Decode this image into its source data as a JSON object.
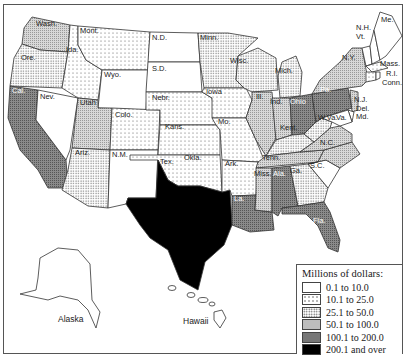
{
  "map": {
    "title": "Millions of dollars by state",
    "legend": {
      "title": "Millions of dollars:",
      "items": [
        {
          "label": "0.1 to 10.0",
          "class": "c1",
          "pattern": "white"
        },
        {
          "label": "10.1 to 25.0",
          "class": "c2",
          "pattern": "sparse-dots"
        },
        {
          "label": "25.1 to 50.0",
          "class": "c3",
          "pattern": "dense-dots"
        },
        {
          "label": "50.1 to 100.0",
          "class": "c4",
          "pattern": "light-gray-hatch"
        },
        {
          "label": "100.1 to 200.0",
          "class": "c5",
          "pattern": "dark-gray-hatch"
        },
        {
          "label": "200.1 and over",
          "class": "c6",
          "pattern": "black"
        }
      ]
    },
    "states": [
      {
        "abbr": "Wash.",
        "class": "c4"
      },
      {
        "abbr": "Ore.",
        "class": "c3"
      },
      {
        "abbr": "Cal.",
        "class": "c5"
      },
      {
        "abbr": "Ida.",
        "class": "c2"
      },
      {
        "abbr": "Nev.",
        "class": "c1"
      },
      {
        "abbr": "Mont.",
        "class": "c2"
      },
      {
        "abbr": "Wyo.",
        "class": "c1"
      },
      {
        "abbr": "Utah",
        "class": "c4"
      },
      {
        "abbr": "Colo.",
        "class": "c2"
      },
      {
        "abbr": "Ariz.",
        "class": "c3"
      },
      {
        "abbr": "N.M.",
        "class": "c1"
      },
      {
        "abbr": "N.D.",
        "class": "c1"
      },
      {
        "abbr": "S.D.",
        "class": "c1"
      },
      {
        "abbr": "Nebr.",
        "class": "c2"
      },
      {
        "abbr": "Kans.",
        "class": "c2"
      },
      {
        "abbr": "Okla.",
        "class": "c2"
      },
      {
        "abbr": "Tex.",
        "class": "c6"
      },
      {
        "abbr": "Minn.",
        "class": "c3"
      },
      {
        "abbr": "Iowa",
        "class": "c2"
      },
      {
        "abbr": "Mo.",
        "class": "c2"
      },
      {
        "abbr": "Ark.",
        "class": "c2"
      },
      {
        "abbr": "La.",
        "class": "c5"
      },
      {
        "abbr": "Wisc.",
        "class": "c3"
      },
      {
        "abbr": "Ill.",
        "class": "c4"
      },
      {
        "abbr": "Mich.",
        "class": "c3"
      },
      {
        "abbr": "Ind.",
        "class": "c4"
      },
      {
        "abbr": "Ohio",
        "class": "c5"
      },
      {
        "abbr": "Kent.",
        "class": "c3"
      },
      {
        "abbr": "Tenn.",
        "class": "c4"
      },
      {
        "abbr": "Miss.",
        "class": "c4"
      },
      {
        "abbr": "Ala.",
        "class": "c5"
      },
      {
        "abbr": "Ga.",
        "class": "c3"
      },
      {
        "abbr": "Fla.",
        "class": "c5"
      },
      {
        "abbr": "S.C.",
        "class": "c3"
      },
      {
        "abbr": "N.C.",
        "class": "c4"
      },
      {
        "abbr": "Va.",
        "class": "c4"
      },
      {
        "abbr": "W.Va.",
        "class": "c3"
      },
      {
        "abbr": "Pa.",
        "class": "c5"
      },
      {
        "abbr": "N.Y.",
        "class": "c4"
      },
      {
        "abbr": "N.J.",
        "class": "c4"
      },
      {
        "abbr": "Del.",
        "class": "c1"
      },
      {
        "abbr": "Md.",
        "class": "c1"
      },
      {
        "abbr": "Conn.",
        "class": "c2"
      },
      {
        "abbr": "R.I.",
        "class": "c1"
      },
      {
        "abbr": "Mass.",
        "class": "c2"
      },
      {
        "abbr": "Vt.",
        "class": "c1"
      },
      {
        "abbr": "N.H.",
        "class": "c1"
      },
      {
        "abbr": "Me.",
        "class": "c1"
      },
      {
        "abbr": "Alaska",
        "class": "c1"
      },
      {
        "abbr": "Hawaii",
        "class": "c1"
      }
    ],
    "insets": {
      "alaska_label": "Alaska",
      "hawaii_label": "Hawaii"
    }
  }
}
